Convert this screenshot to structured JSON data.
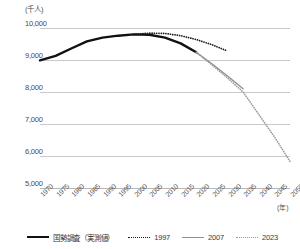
{
  "chart_data": {
    "type": "line",
    "title": "",
    "unit_label": "(千人)",
    "xlabel": "(年)",
    "ylabel": "",
    "ylim": [
      5000,
      10000
    ],
    "ytick_values": [
      10000,
      9000,
      8000,
      7000,
      6000,
      5000
    ],
    "ytick_labels": [
      "10,000",
      "9,000",
      "8,000",
      "7,000",
      "6,000",
      "5,000"
    ],
    "xlim": [
      1970,
      2050
    ],
    "xtick_labels": [
      "1970",
      "1975",
      "1980",
      "1985",
      "1990",
      "1995",
      "2000",
      "2005",
      "2010",
      "2015",
      "2020",
      "2025",
      "2030",
      "2035",
      "2040",
      "2045",
      "2050"
    ],
    "grid": true,
    "legend_position": "bottom",
    "series": [
      {
        "name": "国勢調査（実測値）",
        "style": "solid",
        "color": "#111111",
        "x": [
          1970,
          1975,
          1980,
          1985,
          1990,
          1995,
          2000,
          2005,
          2010,
          2015,
          2020
        ],
        "values": [
          8990,
          9130,
          9360,
          9580,
          9700,
          9760,
          9800,
          9790,
          9700,
          9520,
          9240
        ]
      },
      {
        "name": "1997",
        "style": "dotted",
        "color": "#1a1a1a",
        "x": [
          2000,
          2005,
          2010,
          2015,
          2020,
          2025,
          2030
        ],
        "values": [
          9800,
          9840,
          9830,
          9760,
          9640,
          9480,
          9280
        ]
      },
      {
        "name": "2007",
        "style": "solid",
        "color": "#8f8f8f",
        "x": [
          2020,
          2025,
          2030,
          2035
        ],
        "values": [
          9240,
          8880,
          8500,
          8100
        ]
      },
      {
        "name": "2023",
        "style": "dotted",
        "color": "#9a9a9a",
        "x": [
          2020,
          2025,
          2030,
          2035,
          2040,
          2045,
          2050
        ],
        "values": [
          9240,
          8850,
          8440,
          8000,
          7300,
          6600,
          5830
        ]
      }
    ]
  },
  "legend": {
    "items": [
      {
        "label": "国勢調査（実測値）",
        "swatch": "sw-solid-black",
        "icon": "solid-line-icon"
      },
      {
        "label": "1997",
        "swatch": "sw-dotted-black",
        "icon": "dotted-line-icon"
      },
      {
        "label": "2007",
        "swatch": "sw-solid-gray",
        "icon": "solid-line-icon"
      },
      {
        "label": "2023",
        "swatch": "sw-dotted-gray",
        "icon": "dotted-line-icon"
      }
    ]
  }
}
